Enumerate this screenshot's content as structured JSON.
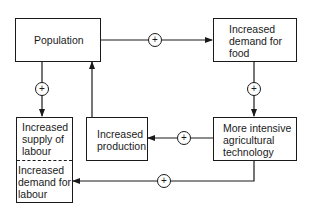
{
  "diagram": {
    "type": "causal-loop-flowchart",
    "nodes": {
      "population": {
        "label": "Population"
      },
      "food_demand": {
        "label": "Increased demand for food",
        "lines": [
          "Increased",
          "demand for",
          "food"
        ]
      },
      "agri_tech": {
        "label": "More intensive agricultural technology",
        "lines": [
          "More intensive",
          "agricultural",
          "technology"
        ]
      },
      "production": {
        "label": "Increased production",
        "lines": [
          "Increased",
          "production"
        ]
      },
      "labour_supply": {
        "label": "Increased supply of labour",
        "lines": [
          "Increased",
          "supply of",
          "labour"
        ]
      },
      "labour_demand": {
        "label": "Increased demand for labour",
        "lines": [
          "Increased",
          "demand for",
          "labour"
        ]
      }
    },
    "edges": [
      {
        "from": "population",
        "to": "food_demand",
        "sign": "+"
      },
      {
        "from": "food_demand",
        "to": "agri_tech",
        "sign": "+"
      },
      {
        "from": "agri_tech",
        "to": "production",
        "sign": "+"
      },
      {
        "from": "production",
        "to": "population",
        "sign": ""
      },
      {
        "from": "population",
        "to": "labour_supply",
        "sign": "+"
      },
      {
        "from": "agri_tech",
        "to": "labour_demand",
        "sign": "+"
      }
    ],
    "sign_symbol": "+"
  }
}
